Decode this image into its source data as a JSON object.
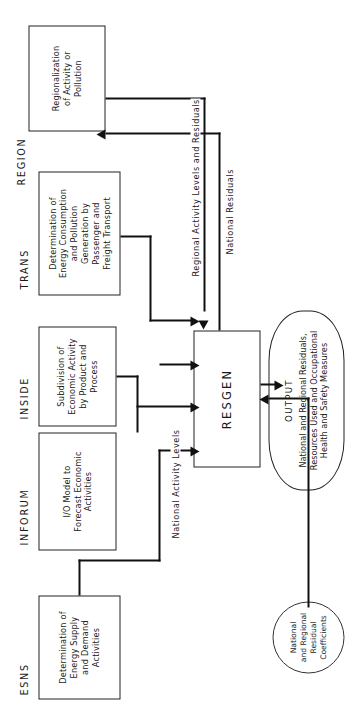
{
  "diagram": {
    "orientation": "rotated-90-ccw",
    "ink_color": "#111111",
    "paper_color": "#ffffff",
    "nodes": {
      "region": {
        "caption": "REGION",
        "body": "Regionalization\nof Activity or\nPollution",
        "shape": "rectangle"
      },
      "trans": {
        "caption": "TRANS",
        "body": "Determination of\nEnergy Consumption\nand Pollution\nGeneration by\nPassenger and\nFreight Transport",
        "shape": "rectangle"
      },
      "inside": {
        "caption": "INSIDE",
        "body": "Subdivision of\nEconomic Activity\nby Product and\nProcess",
        "shape": "rectangle"
      },
      "inforum": {
        "caption": "INFORUM",
        "body": "I/O Model to\nForecast Economic\nActivities",
        "shape": "rectangle"
      },
      "esns": {
        "caption": "ESNS",
        "body": "Determination of\nEnergy Supply\nand Demand\nActivities",
        "shape": "rectangle"
      },
      "resgen": {
        "caption": "",
        "body": "RESGEN",
        "shape": "rectangle"
      },
      "output": {
        "caption": "OUTPUT",
        "body": "National and Regional Residuals,\nResources Used and Occupational\nHealth and Safety Measures",
        "shape": "oval"
      },
      "coefficients": {
        "caption": "",
        "body": "National\nand Regional\nResidual\nCoefficients",
        "shape": "circle"
      }
    },
    "edge_labels": {
      "regional_activity": "Regional Activity Levels and Residuals",
      "national_residuals": "National Residuals",
      "national_activity": "National Activity Levels"
    }
  }
}
